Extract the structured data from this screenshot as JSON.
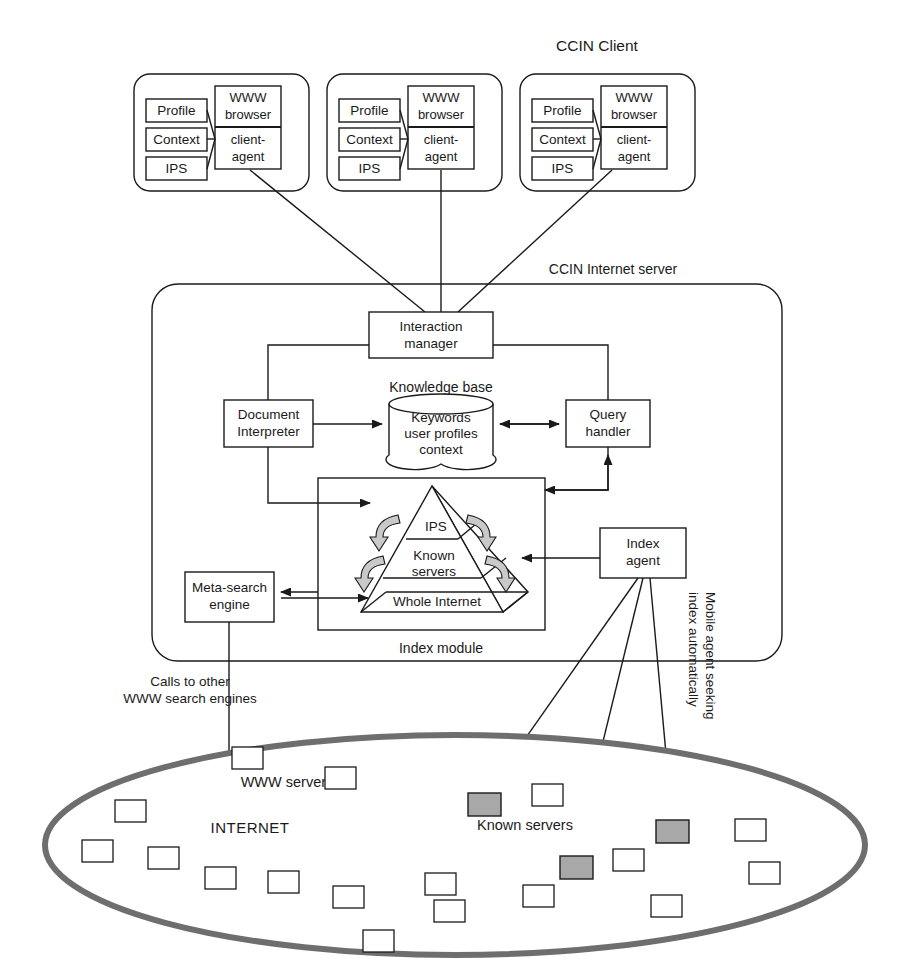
{
  "figure": {
    "caption_partial": ""
  },
  "colors": {
    "line": "#1a1a1a",
    "ellipse_border": "#6e6e6e",
    "known_server_fill": "#a8a8a8",
    "arrow_hook_fill": "#c9c9c9",
    "background": "#ffffff"
  },
  "clients": {
    "group_title": "CCIN Client",
    "instances": [
      {
        "boxes": [
          "Profile",
          "Context",
          "IPS"
        ],
        "browser": "WWW browser",
        "agent": "client-agent"
      },
      {
        "boxes": [
          "Profile",
          "Context",
          "IPS"
        ],
        "browser": "WWW browser",
        "agent": "client-agent"
      },
      {
        "boxes": [
          "Profile",
          "Context",
          "IPS"
        ],
        "browser": "WWW browser",
        "agent": "client-agent"
      }
    ]
  },
  "server": {
    "title": "CCIN Internet server",
    "interaction_manager": "Interaction manager",
    "knowledge_base_label": "Knowledge base",
    "knowledge_base_contents": "Keywords user profiles context",
    "knowledge_base_lines": [
      "Keywords",
      "user profiles",
      "context"
    ],
    "document_interpreter": "Document Interpreter",
    "document_interpreter_lines": [
      "Document",
      "Interpreter"
    ],
    "query_handler": "Query handler",
    "query_handler_lines": [
      "Query",
      "handler"
    ],
    "meta_search_engine": "Meta-search engine",
    "meta_search_engine_lines": [
      "Meta-search",
      "engine"
    ],
    "index_agent": "Index agent",
    "index_agent_lines": [
      "Index",
      "agent"
    ],
    "index_module_label": "Index module",
    "pyramid": {
      "tiers": [
        "IPS",
        "Known servers",
        "Whole Internet"
      ],
      "tier_lines": [
        [
          "IPS"
        ],
        [
          "Known",
          "servers"
        ],
        [
          "Whole Internet"
        ]
      ]
    }
  },
  "annotations": {
    "calls_to_other": "Calls to other WWW search engines",
    "calls_to_other_lines": [
      "Calls to other",
      "WWW search engines"
    ],
    "mobile_agent": "Mobile agent seeking index automatically",
    "mobile_agent_lines": [
      "Mobile agent seeking",
      "index automatically"
    ],
    "www_servers": "WWW servers",
    "known_servers": "Known servers",
    "internet": "INTERNET"
  },
  "internet": {
    "label": "INTERNET",
    "white_servers_count": 17,
    "known_servers_count": 3
  }
}
